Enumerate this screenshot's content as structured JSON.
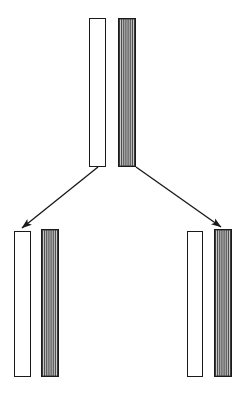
{
  "diagram": {
    "type": "tree-split-diagram",
    "background_color": "#ffffff",
    "line_color": "#1a1a1a",
    "hatch_fill_color": "#3a3a3a",
    "hatch_stripe_color": "#f2f2f2",
    "white_fill_color": "#ffffff",
    "nodes": [
      {
        "id": "parent",
        "label": "parent-node",
        "position": "top-center",
        "bars": [
          {
            "id": "parent-white-bar",
            "style": "white-outline",
            "x": 89,
            "y": 18,
            "width": 16,
            "height": 148
          },
          {
            "id": "parent-hatched-bar",
            "style": "dark-hatched",
            "x": 118,
            "y": 18,
            "width": 17,
            "height": 148,
            "stripe_count": 8
          }
        ]
      },
      {
        "id": "child-left",
        "label": "left-child-node",
        "position": "bottom-left",
        "bars": [
          {
            "id": "child-left-white-bar",
            "style": "white-outline",
            "x": 14,
            "y": 231,
            "width": 16,
            "height": 145
          },
          {
            "id": "child-left-hatched-bar",
            "style": "dark-hatched",
            "x": 41,
            "y": 229,
            "width": 17,
            "height": 147,
            "stripe_count": 8
          }
        ]
      },
      {
        "id": "child-right",
        "label": "right-child-node",
        "position": "bottom-right",
        "bars": [
          {
            "id": "child-right-white-bar",
            "style": "white-outline",
            "x": 187,
            "y": 231,
            "width": 15,
            "height": 145
          },
          {
            "id": "child-right-hatched-bar",
            "style": "dark-hatched",
            "x": 214,
            "y": 229,
            "width": 17,
            "height": 147,
            "stripe_count": 8
          }
        ]
      }
    ],
    "edges": [
      {
        "id": "edge-parent-to-left-child",
        "from": "parent",
        "to": "child-left",
        "x1": 98,
        "y1": 167,
        "x2": 22,
        "y2": 228,
        "arrowhead": "filled-triangle",
        "arrowhead_at": "end"
      },
      {
        "id": "edge-parent-to-right-child",
        "from": "parent",
        "to": "child-right",
        "x1": 136,
        "y1": 167,
        "x2": 221,
        "y2": 227,
        "arrowhead": "filled-triangle",
        "arrowhead_at": "end"
      }
    ]
  }
}
